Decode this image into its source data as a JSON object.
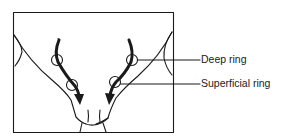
{
  "figure": {
    "labels": [
      {
        "id": "deep",
        "text": "Deep ring"
      },
      {
        "id": "superficial",
        "text": "Superficial ring"
      }
    ],
    "colors": {
      "line": "#1a1a1a",
      "background": "#ffffff"
    }
  }
}
